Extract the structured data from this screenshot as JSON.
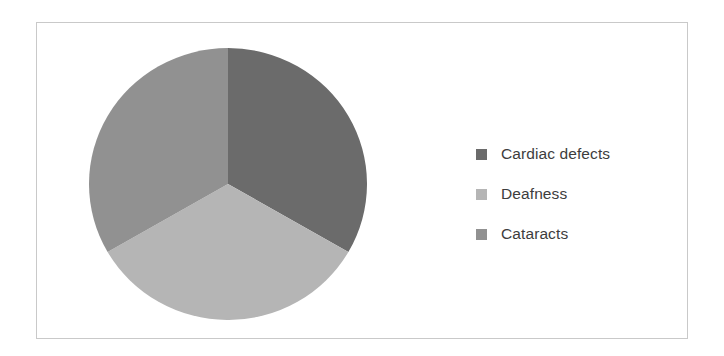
{
  "figure": {
    "background_color": "#ffffff",
    "frame_border_color": "#c9c9c9"
  },
  "legend": {
    "position": "right",
    "entries": [
      {
        "label": "Cardiac defects",
        "color": "#6b6b6b",
        "swatch_icon": "square-swatch-icon"
      },
      {
        "label": "Deafness",
        "color": "#b5b5b5",
        "swatch_icon": "square-swatch-icon"
      },
      {
        "label": "Cataracts",
        "color": "#919191",
        "swatch_icon": "square-swatch-icon"
      }
    ]
  },
  "chart_data": {
    "type": "pie",
    "title": "",
    "subtitle": "",
    "xlabel": "",
    "ylabel": "",
    "grid": false,
    "legend_position": "right",
    "start_angle_deg": 0,
    "direction": "clockwise",
    "categories": [
      "Cardiac defects",
      "Deafness",
      "Cataracts"
    ],
    "values": [
      33.3,
      33.3,
      33.3
    ],
    "colors": [
      "#6b6b6b",
      "#b5b5b5",
      "#919191"
    ],
    "slices": [
      {
        "label": "Cardiac defects",
        "value": 33.3,
        "percent": 33.3,
        "start_deg": 0,
        "end_deg": 120,
        "color": "#6b6b6b"
      },
      {
        "label": "Deafness",
        "value": 33.3,
        "percent": 33.3,
        "start_deg": 120,
        "end_deg": 240,
        "color": "#b5b5b5"
      },
      {
        "label": "Cataracts",
        "value": 33.3,
        "percent": 33.3,
        "start_deg": 240,
        "end_deg": 360,
        "color": "#919191"
      }
    ],
    "data_labels_shown": false,
    "annotations": []
  }
}
